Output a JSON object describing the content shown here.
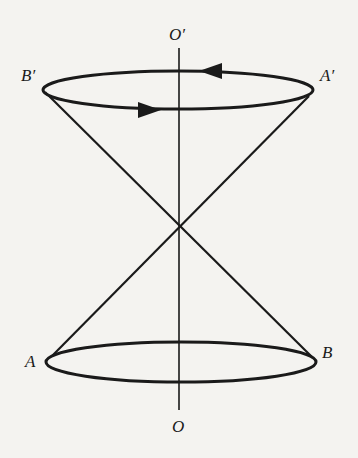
{
  "diagram": {
    "type": "double-cone-rotation",
    "labels": {
      "top_axis": "O′",
      "bottom_axis": "O",
      "top_left": "B′",
      "top_right": "A′",
      "bottom_left": "A",
      "bottom_right": "B"
    },
    "colors": {
      "background": "#f4f3f0",
      "stroke": "#1a1a1a"
    },
    "geometry": {
      "axis": {
        "x": 179,
        "y_top": 48,
        "y_bottom": 410
      },
      "apex": {
        "x": 179,
        "y": 225
      },
      "top_ellipse": {
        "cx": 178,
        "cy": 90,
        "rx": 135,
        "ry": 19
      },
      "bottom_ellipse": {
        "cx": 181,
        "cy": 362,
        "rx": 135,
        "ry": 20
      },
      "arrows": [
        {
          "position": "top-back",
          "direction": "left",
          "x": 211,
          "y": 71
        },
        {
          "position": "top-front",
          "direction": "right",
          "x": 149,
          "y": 110
        }
      ]
    }
  }
}
